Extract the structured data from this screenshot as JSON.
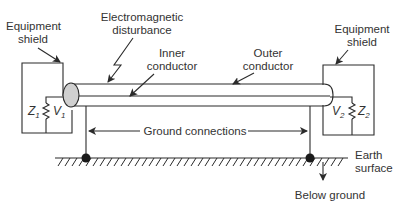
{
  "diagram": {
    "labels": {
      "equipment_shield_left": [
        "Equipment",
        "shield"
      ],
      "equipment_shield_right": [
        "Equipment",
        "shield"
      ],
      "em_disturbance": [
        "Electromagnetic",
        "disturbance"
      ],
      "inner_conductor": [
        "Inner",
        "conductor"
      ],
      "outer_conductor": [
        "Outer",
        "conductor"
      ],
      "ground_connections": "Ground connections",
      "earth_surface": [
        "Earth",
        "surface"
      ],
      "below_ground": "Below ground"
    },
    "symbols": {
      "z1": {
        "base": "Z",
        "sub": "1"
      },
      "v1": {
        "base": "V",
        "sub": "1"
      },
      "z2": {
        "base": "Z",
        "sub": "2"
      },
      "v2": {
        "base": "V",
        "sub": "2"
      }
    },
    "colors": {
      "line": "#2b2b2b",
      "text": "#333333",
      "ellipse_fill": "#d0d0d0",
      "background": "#ffffff"
    }
  }
}
